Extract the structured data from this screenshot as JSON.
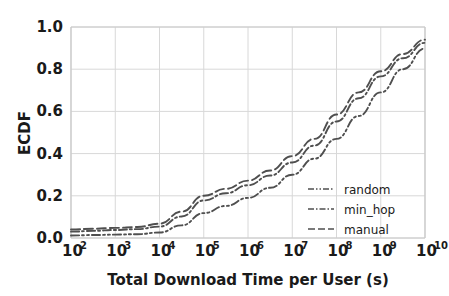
{
  "chart_data": {
    "type": "line",
    "title": "",
    "xlabel": "Total Download Time per User (s)",
    "ylabel": "ECDF",
    "xscale": "log",
    "yscale": "linear",
    "xlim": [
      100,
      10000000000
    ],
    "ylim": [
      0.0,
      1.0
    ],
    "grid": true,
    "legend_position": "lower right",
    "xticks": [
      {
        "value": 100,
        "label": "10",
        "exponent": "2"
      },
      {
        "value": 1000,
        "label": "10",
        "exponent": "3"
      },
      {
        "value": 10000,
        "label": "10",
        "exponent": "4"
      },
      {
        "value": 100000,
        "label": "10",
        "exponent": "5"
      },
      {
        "value": 1000000,
        "label": "10",
        "exponent": "6"
      },
      {
        "value": 10000000,
        "label": "10",
        "exponent": "7"
      },
      {
        "value": 100000000,
        "label": "10",
        "exponent": "8"
      },
      {
        "value": 1000000000,
        "label": "10",
        "exponent": "9"
      },
      {
        "value": 10000000000,
        "label": "10",
        "exponent": "10"
      }
    ],
    "yticks": [
      {
        "value": 0.0,
        "label": "0.0"
      },
      {
        "value": 0.2,
        "label": "0.2"
      },
      {
        "value": 0.4,
        "label": "0.4"
      },
      {
        "value": 0.6,
        "label": "0.6"
      },
      {
        "value": 0.8,
        "label": "0.8"
      },
      {
        "value": 1.0,
        "label": "1.0"
      }
    ],
    "x": [
      100,
      316,
      1000,
      3160,
      10000,
      31600,
      100000,
      316000,
      1000000,
      3160000,
      10000000,
      31600000,
      100000000,
      316000000,
      1000000000,
      3160000000,
      10000000000
    ],
    "series": [
      {
        "name": "manual",
        "color": "#4f4f4f",
        "dash": "dash-dash",
        "dasharray": "9,4",
        "values": [
          0.04,
          0.044,
          0.048,
          0.052,
          0.068,
          0.125,
          0.2,
          0.233,
          0.272,
          0.32,
          0.388,
          0.47,
          0.585,
          0.69,
          0.79,
          0.872,
          0.94
        ]
      },
      {
        "name": "min_hop",
        "color": "#4f4f4f",
        "dash": "dash-dot",
        "dasharray": "8,3,2,3",
        "values": [
          0.03,
          0.034,
          0.038,
          0.042,
          0.054,
          0.102,
          0.178,
          0.212,
          0.25,
          0.296,
          0.358,
          0.438,
          0.552,
          0.662,
          0.766,
          0.852,
          0.925
        ]
      },
      {
        "name": "random",
        "color": "#4f4f4f",
        "dash": "dash-dot-dot",
        "dasharray": "8,3,2,3,2,3",
        "values": [
          0.012,
          0.014,
          0.016,
          0.018,
          0.026,
          0.06,
          0.118,
          0.152,
          0.19,
          0.238,
          0.3,
          0.376,
          0.47,
          0.578,
          0.69,
          0.8,
          0.898
        ]
      }
    ],
    "legend_entries": [
      {
        "label": "random",
        "dasharray": "6,2,1.5,2,1.5,2"
      },
      {
        "label": "min_hop",
        "dasharray": "6,2,1.5,2"
      },
      {
        "label": "manual",
        "dasharray": "7,3"
      }
    ],
    "colors": {
      "line": "#4f4f4f",
      "grid": "#d8d8d8",
      "text": "#1a1a1a",
      "background": "#ffffff"
    }
  }
}
